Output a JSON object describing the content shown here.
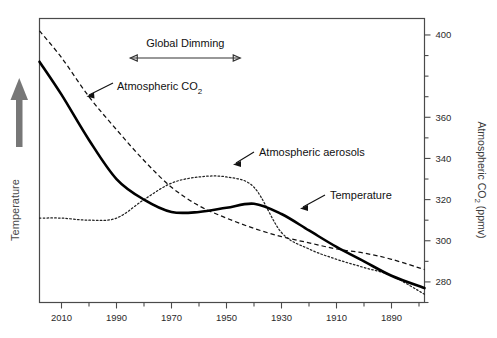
{
  "chart_data": {
    "type": "line",
    "title": "",
    "subtitle": "",
    "xlabel": "",
    "ylabel_left": "Temperature",
    "ylabel_right": "Atmospheric CO 2 (ppmv)",
    "ylabel_right_parts": {
      "main": "Atmospheric CO",
      "sub": "2",
      "unit": " (ppmv)"
    },
    "grid": false,
    "legend": "none",
    "x_axis": {
      "reversed": true,
      "tick_labels": [
        "2010",
        "1990",
        "1970",
        "1950",
        "1930",
        "1910",
        "1890"
      ],
      "tick_values": [
        2010,
        1990,
        1970,
        1950,
        1930,
        1910,
        1890
      ],
      "minor_tick_values": [
        2000,
        1980,
        1960,
        1940,
        1920,
        1900,
        1880
      ],
      "range_left": 2018,
      "range_right": 1878
    },
    "y_axis_right": {
      "tick_labels": [
        "400",
        "360",
        "340",
        "320",
        "300",
        "280"
      ],
      "tick_values": [
        400,
        360,
        340,
        320,
        300,
        280
      ],
      "minor_tick_values": [
        390,
        380,
        370,
        350,
        330,
        310,
        290,
        270
      ],
      "range": [
        270,
        408
      ]
    },
    "annotations": [
      {
        "name": "global-dimming",
        "text": "Global Dimming",
        "from_year": 1945,
        "to_year": 1985
      },
      {
        "name": "co2-callout",
        "text_main": "Atmospheric CO",
        "text_sub": "2",
        "text": "Atmospheric CO2"
      },
      {
        "name": "aerosols-callout",
        "text": "Atmospheric aerosols"
      },
      {
        "name": "temperature-callout",
        "text": "Temperature"
      }
    ],
    "series": [
      {
        "name": "Atmospheric CO2",
        "style": "dashed",
        "unit": "ppmv",
        "x": [
          2018,
          2010,
          2000,
          1990,
          1980,
          1970,
          1960,
          1950,
          1940,
          1930,
          1920,
          1910,
          1900,
          1890,
          1878
        ],
        "values": [
          402,
          389,
          370,
          354,
          339,
          326,
          317,
          311,
          306,
          302,
          299,
          296,
          294,
          291,
          286
        ]
      },
      {
        "name": "Temperature",
        "style": "solid",
        "unit": "relative",
        "x": [
          2018,
          2010,
          2000,
          1990,
          1980,
          1970,
          1960,
          1950,
          1940,
          1930,
          1920,
          1910,
          1900,
          1890,
          1878
        ],
        "values": [
          387,
          371,
          349,
          330,
          320,
          314,
          314,
          316,
          318,
          313,
          305,
          297,
          290,
          283,
          277
        ]
      },
      {
        "name": "Atmospheric aerosols",
        "style": "dotted",
        "unit": "relative",
        "x": [
          2018,
          2010,
          2000,
          1990,
          1980,
          1970,
          1960,
          1950,
          1940,
          1930,
          1920,
          1910,
          1900,
          1890,
          1878
        ],
        "values": [
          311,
          311,
          310,
          311,
          320,
          328,
          331,
          331,
          326,
          304,
          296,
          291,
          287,
          283,
          274
        ]
      }
    ]
  },
  "plot": {
    "frame_name": "plot-frame"
  }
}
